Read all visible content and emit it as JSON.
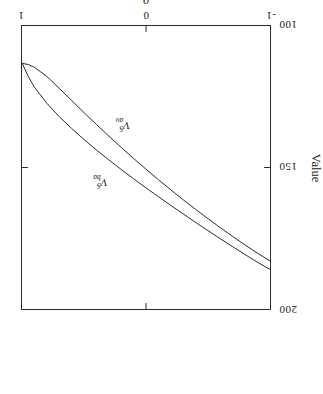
{
  "figure": {
    "background_color": "#ffffff",
    "line_color": "#2b2b2b",
    "orientation_note": "scan rotated 180 degrees"
  },
  "axes": {
    "y_title": "Value",
    "x_title": "ρ"
  },
  "labels": {
    "curve_1": {
      "base": "V",
      "sup": "S",
      "sub": "ba"
    },
    "curve_2": {
      "base": "V",
      "sup": "S",
      "sub": "ao"
    }
  },
  "chart_data": {
    "type": "line",
    "title": "",
    "xlabel": "ρ",
    "ylabel": "Value",
    "xlim": [
      -1,
      1
    ],
    "ylim": [
      100,
      200
    ],
    "xticks": [
      -1,
      0,
      1
    ],
    "xticklabels": [
      "-1",
      "0",
      "1"
    ],
    "yticks": [
      100,
      150,
      200
    ],
    "yticklabels": [
      "100",
      "150",
      "200"
    ],
    "grid": false,
    "legend": "inline-curve-labels",
    "series": [
      {
        "name": "V^S_ba",
        "label": "V_{ba}^{S}",
        "x": [
          -1.0,
          -0.9,
          -0.8,
          -0.7,
          -0.6,
          -0.5,
          -0.4,
          -0.3,
          -0.2,
          -0.1,
          0.0,
          0.1,
          0.2,
          0.3,
          0.4,
          0.5,
          0.6,
          0.7,
          0.8,
          0.9,
          0.95,
          1.0
        ],
        "y": [
          186.0,
          183.5,
          180.8,
          178.0,
          175.2,
          172.3,
          169.4,
          166.4,
          163.4,
          160.3,
          157.2,
          154.0,
          150.7,
          147.3,
          143.8,
          140.1,
          136.2,
          132.0,
          127.3,
          121.6,
          117.8,
          113.0
        ]
      },
      {
        "name": "V^S_ao",
        "label": "V_{ao}^{S}",
        "x": [
          -1.0,
          -0.9,
          -0.8,
          -0.7,
          -0.6,
          -0.5,
          -0.4,
          -0.3,
          -0.2,
          -0.1,
          0.0,
          0.1,
          0.2,
          0.3,
          0.4,
          0.5,
          0.6,
          0.7,
          0.8,
          0.9,
          0.95,
          1.0
        ],
        "y": [
          183.0,
          180.3,
          177.4,
          174.4,
          171.3,
          168.1,
          164.8,
          161.4,
          157.9,
          154.3,
          150.6,
          146.8,
          142.9,
          138.9,
          134.8,
          130.6,
          126.3,
          122.0,
          117.8,
          114.6,
          113.6,
          113.2
        ]
      }
    ],
    "annotations": [
      {
        "text": "V^S_ba",
        "x": 0.3,
        "y": 155.0
      },
      {
        "text": "V^S_ao",
        "x": 0.12,
        "y": 135.0
      }
    ]
  },
  "ticks": {
    "y": [
      {
        "value": 200,
        "label": "200"
      },
      {
        "value": 150,
        "label": "150"
      },
      {
        "value": 100,
        "label": "100"
      }
    ],
    "x": [
      {
        "value": -1,
        "label": "-1"
      },
      {
        "value": 0,
        "label": "0"
      },
      {
        "value": 1,
        "label": "1"
      }
    ]
  }
}
